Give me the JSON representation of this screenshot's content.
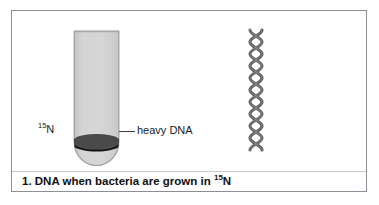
{
  "figure": {
    "caption_prefix": "1. DNA when bacteria are grown in ",
    "caption_isotope_sup": "15",
    "caption_isotope_element": "N",
    "border_color": "#8d8f96",
    "background": "#ffffff"
  },
  "test_tube": {
    "name": "test-tube",
    "fill_color": "#d2d2d2",
    "outline_color": "#9a9a9a",
    "band": {
      "label": "heavy DNA",
      "fill_color": "#4a4a4a",
      "outline_color": "#141414"
    },
    "isotope_label": {
      "superscript": "15",
      "element": "N"
    }
  },
  "dna_helix": {
    "name": "dna-double-helix",
    "strand_color": "#4f5052",
    "strand_highlight": "#8e9094",
    "turns": 6
  }
}
